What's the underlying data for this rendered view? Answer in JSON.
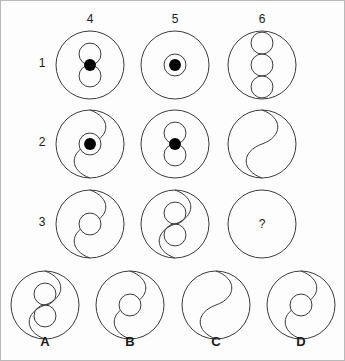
{
  "puzzle": {
    "title": "Matrix reasoning puzzle",
    "type": "visual-analogy-matrix",
    "stroke_color": "#3b3b3b",
    "fill_color": "#000000",
    "background_color": "#fdfdfd",
    "border_color": "#b9b9b9",
    "missing_marker": "?"
  },
  "column_headers": [
    {
      "label": "4",
      "x": 89,
      "y": 19
    },
    {
      "label": "5",
      "x": 174,
      "y": 19
    },
    {
      "label": "6",
      "x": 261,
      "y": 19
    }
  ],
  "row_headers": [
    {
      "label": "1",
      "x": 41,
      "y": 63
    },
    {
      "label": "2",
      "x": 41,
      "y": 142
    },
    {
      "label": "3",
      "x": 41,
      "y": 222
    }
  ],
  "matrix": [
    {
      "row": "1",
      "cells": [
        {
          "id": "cell-r1c4",
          "column": "4",
          "cx": 89,
          "cy": 64,
          "r": 34,
          "description": "large circle containing two open circles stacked vertically with a filled dot between them",
          "divider": "none",
          "inner_circles": 2,
          "filled_dot": true,
          "dot_ring": false
        },
        {
          "id": "cell-r1c5",
          "column": "5",
          "cx": 174,
          "cy": 64,
          "r": 34,
          "description": "large circle containing a small ring with a filled dot at the centre",
          "divider": "none",
          "inner_circles": 0,
          "filled_dot": true,
          "dot_ring": true
        },
        {
          "id": "cell-r1c6",
          "column": "6",
          "cx": 261,
          "cy": 64,
          "r": 34,
          "description": "large circle containing three open circles stacked vertically",
          "divider": "none",
          "inner_circles": 3,
          "filled_dot": false,
          "dot_ring": false
        }
      ]
    },
    {
      "row": "2",
      "cells": [
        {
          "id": "cell-r2c4",
          "column": "4",
          "cx": 89,
          "cy": 143,
          "r": 34,
          "description": "large circle split by an S-curve with a filled dot inside a ring at the centre",
          "divider": "s-curve",
          "inner_circles": 0,
          "filled_dot": true,
          "dot_ring": true
        },
        {
          "id": "cell-r2c5",
          "column": "5",
          "cx": 174,
          "cy": 143,
          "r": 34,
          "description": "large circle containing two open circles stacked vertically with a filled dot between them",
          "divider": "none",
          "inner_circles": 2,
          "filled_dot": true,
          "dot_ring": false
        },
        {
          "id": "cell-r2c6",
          "column": "6",
          "cx": 261,
          "cy": 143,
          "r": 34,
          "description": "large circle split by a plain S-curve, no inner circles",
          "divider": "s-curve",
          "inner_circles": 0,
          "filled_dot": false,
          "dot_ring": false
        }
      ]
    },
    {
      "row": "3",
      "cells": [
        {
          "id": "cell-r3c4",
          "column": "4",
          "cx": 89,
          "cy": 223,
          "r": 34,
          "description": "large circle split by an S-curve with one open circle at the centre",
          "divider": "s-curve",
          "inner_circles": 1,
          "filled_dot": false,
          "dot_ring": false
        },
        {
          "id": "cell-r3c5",
          "column": "5",
          "cx": 174,
          "cy": 223,
          "r": 34,
          "description": "large circle containing two open circles stacked vertically joined by an S-curve",
          "divider": "s-curve",
          "inner_circles": 2,
          "filled_dot": false,
          "dot_ring": false
        },
        {
          "id": "cell-r3c6",
          "column": "6",
          "cx": 261,
          "cy": 223,
          "r": 34,
          "description": "empty circle containing a question mark — the missing tile",
          "divider": "none",
          "inner_circles": 0,
          "filled_dot": false,
          "dot_ring": false,
          "is_missing": true,
          "marker": "?"
        }
      ]
    }
  ],
  "options": [
    {
      "id": "option-a",
      "label": "A",
      "cx": 44,
      "cy": 304,
      "r": 34,
      "label_x": 44,
      "label_y": 341,
      "description": "large circle with two open circles stacked vertically joined by an S-curve",
      "divider": "s-curve",
      "inner_circles": 2,
      "filled_dot": false,
      "dot_ring": false
    },
    {
      "id": "option-b",
      "label": "B",
      "cx": 129,
      "cy": 304,
      "r": 34,
      "label_x": 129,
      "label_y": 341,
      "description": "large circle split by an S-curve with one open circle at the centre",
      "divider": "s-curve",
      "inner_circles": 1,
      "filled_dot": false,
      "dot_ring": false
    },
    {
      "id": "option-c",
      "label": "C",
      "cx": 215,
      "cy": 304,
      "r": 34,
      "label_x": 215,
      "label_y": 341,
      "description": "large circle split by a plain S-curve, no inner circles",
      "divider": "s-curve",
      "inner_circles": 0,
      "filled_dot": false,
      "dot_ring": false
    },
    {
      "id": "option-d",
      "label": "D",
      "cx": 300,
      "cy": 304,
      "r": 34,
      "label_x": 300,
      "label_y": 341,
      "description": "large circle split by an S-curve with one open circle at the centre",
      "divider": "s-curve",
      "inner_circles": 1,
      "filled_dot": false,
      "dot_ring": false
    }
  ]
}
